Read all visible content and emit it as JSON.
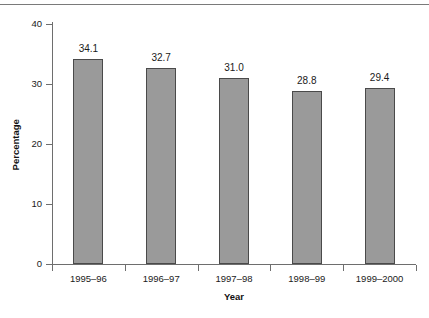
{
  "chart_data": {
    "type": "bar",
    "title": "",
    "xlabel": "Year",
    "ylabel": "Percentage",
    "categories": [
      "1995–96",
      "1996–97",
      "1997–98",
      "1998–99",
      "1999–2000"
    ],
    "values": [
      34.1,
      32.7,
      31.0,
      28.8,
      29.4
    ],
    "value_labels": [
      "34.1",
      "32.7",
      "31.0",
      "28.8",
      "29.4"
    ],
    "ylim": [
      0,
      40
    ],
    "yticks": [
      0,
      10,
      20,
      30,
      40
    ],
    "ytick_labels": [
      "0",
      "10",
      "20",
      "30",
      "40"
    ],
    "grid": false,
    "legend": null,
    "bar_color": "#9a9a9a",
    "bar_border_color": "#4a4a4a",
    "axis_color": "#6e6e6e"
  }
}
